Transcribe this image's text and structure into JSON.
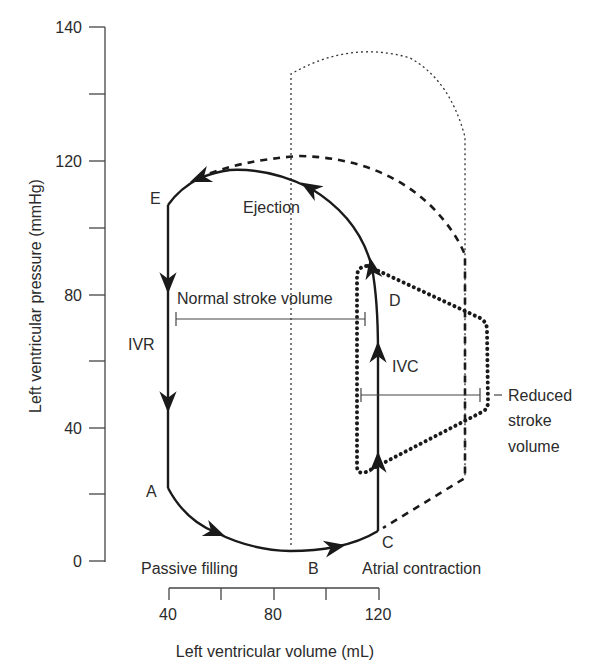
{
  "diagram": {
    "type": "pressure-volume loop",
    "y_axis": {
      "title": "Left ventricular pressure (mmHg)",
      "tick_labels": [
        "140",
        "120",
        "80",
        "40",
        "0"
      ]
    },
    "x_axis": {
      "title": "Left ventricular volume (mL)",
      "tick_labels": [
        "40",
        "80",
        "120"
      ]
    },
    "points": {
      "a": "A",
      "b": "B",
      "c": "C",
      "d": "D",
      "e": "E"
    },
    "phases": {
      "ejection": "Ejection",
      "ivr": "IVR",
      "ivc": "IVC",
      "passive_filling": "Passive filling",
      "atrial_contraction": "Atrial contraction"
    },
    "annotations": {
      "normal_stroke_volume": "Normal stroke volume",
      "reduced_stroke_volume_line1": "Reduced",
      "reduced_stroke_volume_line2": "stroke",
      "reduced_stroke_volume_line3": "volume"
    },
    "line_styles": {
      "normal_loop": "solid",
      "increased_afterload_loop": "dashed",
      "reduced_loop": "heavy-dotted",
      "reference_outline": "thin-dotted"
    },
    "colors": {
      "ink": "#1a1a1a",
      "text": "#2b2b2b",
      "axis": "#444444"
    }
  }
}
